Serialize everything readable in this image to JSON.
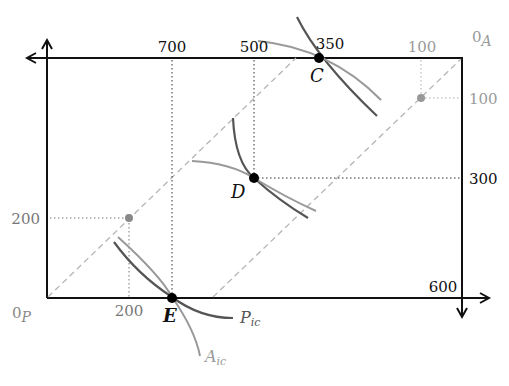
{
  "diagram": {
    "type": "edgeworth-box",
    "origins": {
      "p": {
        "label": "0",
        "sub": "P"
      },
      "a": {
        "label": "0",
        "sub": "A"
      }
    },
    "points": {
      "C": {
        "label": "C"
      },
      "D": {
        "label": "D"
      },
      "E": {
        "label": "E"
      }
    },
    "curve_labels": {
      "p_ic": {
        "label": "P",
        "sub": "ic"
      },
      "a_ic": {
        "label": "A",
        "sub": "ic"
      }
    },
    "top_axis_labels": [
      "700",
      "500",
      "350",
      "100"
    ],
    "bottom_axis_labels": [
      "200",
      "600"
    ],
    "left_axis_labels": [
      "200"
    ],
    "right_axis_labels": [
      "100",
      "300"
    ],
    "colors": {
      "axis": "#111111",
      "p_curve": "#555555",
      "a_curve": "#999999",
      "dashed": "#b5b5b5",
      "guide": "#333333",
      "grey_point": "#888888",
      "grey_text": "#9a9a9a"
    }
  }
}
